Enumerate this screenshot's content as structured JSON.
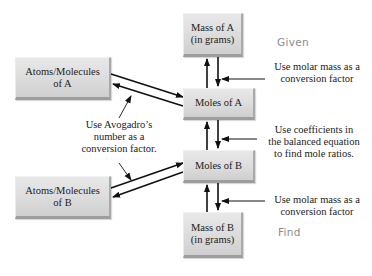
{
  "diagram": {
    "boxes": {
      "mass_a": {
        "line1": "Mass of A",
        "line2": "(in grams)"
      },
      "moles_a": {
        "line1": "Moles of A"
      },
      "moles_b": {
        "line1": "Moles of B"
      },
      "mass_b": {
        "line1": "Mass of B",
        "line2": "(in grams)"
      },
      "atoms_a": {
        "line1": "Atoms/Molecules",
        "line2": "of A"
      },
      "atoms_b": {
        "line1": "Atoms/Molecules",
        "line2": "of B"
      }
    },
    "annotations": {
      "molar_mass_top": {
        "line1": "Use molar mass as a",
        "line2": "conversion factor"
      },
      "coefficients": {
        "line1": "Use coefficients in",
        "line2": "the balanced equation",
        "line3": "to find mole ratios."
      },
      "molar_mass_bottom": {
        "line1": "Use molar mass as a",
        "line2": "conversion factor"
      },
      "avogadro": {
        "line1": "Use Avogadro’s",
        "line2": "number as a",
        "line3": "conversion factor."
      }
    },
    "status": {
      "given": "Given",
      "find": "Find"
    },
    "colors": {
      "box_fill": "#dcdcdc",
      "arrow": "#111111",
      "status_text": "#8c8c8c"
    }
  }
}
